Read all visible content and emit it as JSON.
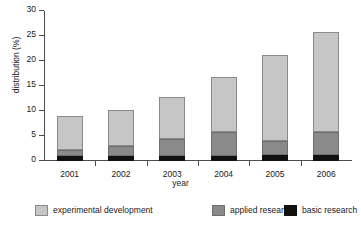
{
  "chart_data": {
    "type": "bar",
    "stacked": true,
    "title": "",
    "xlabel": "year",
    "ylabel": "distribution (%)",
    "categories": [
      "2001",
      "2002",
      "2003",
      "2004",
      "2005",
      "2006"
    ],
    "ylim": [
      0,
      30
    ],
    "yticks": [
      0,
      5,
      10,
      15,
      20,
      25,
      30
    ],
    "grid": false,
    "legend_position": "bottom",
    "series": [
      {
        "name": "basic research",
        "color": "#111111",
        "values": [
          1.0,
          1.0,
          1.0,
          1.0,
          1.2,
          1.2
        ]
      },
      {
        "name": "applied research",
        "color": "#8a8a8a",
        "values": [
          1.3,
          2.0,
          3.5,
          4.8,
          2.9,
          4.6
        ]
      },
      {
        "name": "experimental development",
        "color": "#c6c6c6",
        "values": [
          6.7,
          7.2,
          8.3,
          11.0,
          17.1,
          20.0
        ]
      }
    ],
    "totals": [
      9.0,
      10.2,
      12.8,
      16.8,
      21.2,
      25.8
    ]
  },
  "axes": {
    "ylabel": "distribution (%)",
    "xlabel": "year",
    "ytick_labels": [
      "0",
      "5",
      "10",
      "15",
      "20",
      "25",
      "30"
    ],
    "xtick_labels": [
      "2001",
      "2002",
      "2003",
      "2004",
      "2005",
      "2006"
    ]
  },
  "legend": {
    "items": [
      {
        "label": "experimental development",
        "color": "#c6c6c6"
      },
      {
        "label": "applied research",
        "color": "#8a8a8a"
      },
      {
        "label": "basic research",
        "color": "#111111"
      }
    ]
  }
}
